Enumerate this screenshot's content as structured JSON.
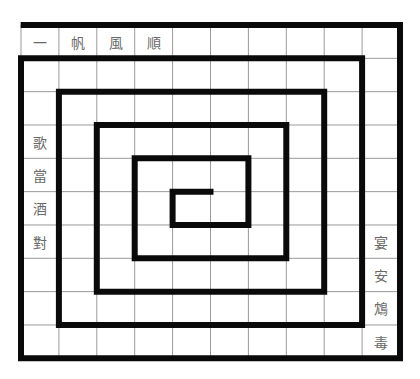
{
  "puzzle": {
    "cols": 10,
    "rows": 10,
    "grid": [
      [
        "一",
        "帆",
        "風",
        "順",
        "",
        "",
        "",
        "",
        "",
        ""
      ],
      [
        "",
        "",
        "",
        "",
        "",
        "",
        "",
        "",
        "",
        ""
      ],
      [
        "",
        "",
        "",
        "",
        "",
        "",
        "",
        "",
        "",
        ""
      ],
      [
        "歌",
        "",
        "",
        "",
        "",
        "",
        "",
        "",
        "",
        ""
      ],
      [
        "當",
        "",
        "",
        "",
        "",
        "",
        "",
        "",
        "",
        ""
      ],
      [
        "酒",
        "",
        "",
        "",
        "",
        "",
        "",
        "",
        "",
        ""
      ],
      [
        "對",
        "",
        "",
        "",
        "",
        "",
        "",
        "",
        "",
        "宴"
      ],
      [
        "",
        "",
        "",
        "",
        "",
        "",
        "",
        "",
        "",
        "安"
      ],
      [
        "",
        "",
        "",
        "",
        "",
        "",
        "",
        "",
        "",
        "鴆"
      ],
      [
        "",
        "",
        "",
        "",
        "",
        "",
        "",
        "",
        "",
        "毒"
      ]
    ],
    "spiral_path_grid_units": [
      [
        5,
        5
      ],
      [
        4,
        5
      ],
      [
        4,
        6
      ],
      [
        6,
        6
      ],
      [
        6,
        4
      ],
      [
        3,
        4
      ],
      [
        3,
        7
      ],
      [
        7,
        7
      ],
      [
        7,
        3
      ],
      [
        2,
        3
      ],
      [
        2,
        8
      ],
      [
        8,
        8
      ],
      [
        8,
        2
      ],
      [
        1,
        2
      ],
      [
        1,
        9
      ],
      [
        9,
        9
      ],
      [
        9,
        1
      ],
      [
        0,
        1
      ],
      [
        0,
        10
      ],
      [
        10,
        10
      ],
      [
        10,
        0
      ],
      [
        0.07,
        0
      ]
    ],
    "colors": {
      "spiral_line": "#0a0a0a",
      "grid_line": "#9a9a9a",
      "text": "#6a6a6a",
      "background": "#ffffff"
    }
  }
}
